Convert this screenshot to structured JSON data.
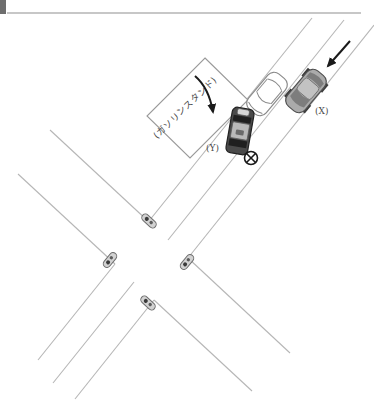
{
  "header": {
    "accent_square_color": "#6e6e6e",
    "rule_color": "#b4b4b4"
  },
  "diagram": {
    "gas_station": {
      "label": "(ガソリンスタンド)",
      "outline_color": "#9a9a9a"
    },
    "vehicles": {
      "car_x": {
        "label": "(X)",
        "type": "passenger-car",
        "body_color": "#ababab",
        "heading": "southwest"
      },
      "car_white": {
        "label": "",
        "type": "passenger-car",
        "body_color": "#ffffff",
        "heading": "southwest"
      },
      "car_y": {
        "label": "(Y)",
        "type": "passenger-car",
        "body_color": "#4a4a4a",
        "heading": "south"
      },
      "small_vehicles_at_intersection": 4
    },
    "collision_marker": {
      "symbol": "circled-x",
      "color": "#1a1a1a"
    },
    "arrows": {
      "count": 2,
      "color": "#1a1a1a"
    },
    "colors": {
      "road_line": "#b6b6b6",
      "label_text": "#4a4a4a"
    }
  }
}
